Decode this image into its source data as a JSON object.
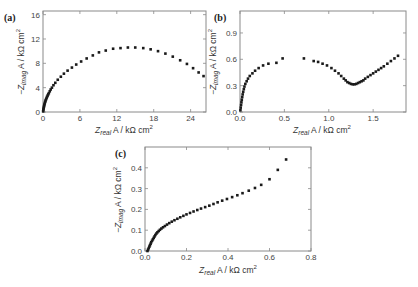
{
  "chart_data": [
    {
      "panel": "(a)",
      "type": "scatter",
      "title": "",
      "xlabel": "Z_real A / kΩ cm²",
      "ylabel": "−Z_imag A / kΩ cm²",
      "xlim": [
        0,
        26.5
      ],
      "ylim": [
        0,
        16.6
      ],
      "xticks": [
        0,
        6,
        12,
        18,
        24
      ],
      "yticks": [
        0,
        4,
        8,
        12,
        16
      ],
      "grid": false,
      "legend": null,
      "series": [
        {
          "name": "a",
          "x": [
            0.02,
            0.05,
            0.08,
            0.12,
            0.16,
            0.2,
            0.25,
            0.3,
            0.36,
            0.42,
            0.5,
            0.58,
            0.66,
            0.75,
            0.85,
            0.95,
            1.1,
            1.25,
            1.45,
            1.7,
            2.0,
            2.4,
            2.9,
            3.4,
            4.0,
            4.7,
            5.4,
            6.2,
            7.1,
            8.1,
            9.1,
            10.2,
            11.4,
            12.6,
            13.8,
            15.0,
            16.3,
            17.5,
            18.7,
            19.9,
            21.1,
            22.3,
            23.4,
            24.4,
            25.3,
            26.1
          ],
          "y": [
            0.1,
            0.3,
            0.5,
            0.7,
            0.9,
            1.1,
            1.3,
            1.5,
            1.7,
            1.9,
            2.1,
            2.3,
            2.5,
            2.7,
            2.9,
            3.1,
            3.4,
            3.7,
            4.0,
            4.4,
            4.8,
            5.3,
            5.8,
            6.3,
            6.8,
            7.3,
            7.8,
            8.3,
            8.8,
            9.3,
            9.8,
            10.1,
            10.4,
            10.5,
            10.6,
            10.6,
            10.5,
            10.3,
            10.0,
            9.6,
            9.1,
            8.5,
            7.9,
            7.2,
            6.5,
            5.9
          ]
        }
      ]
    },
    {
      "panel": "(b)",
      "type": "scatter",
      "title": "",
      "xlabel": "Z_real A / kΩ cm²",
      "ylabel": "−Z_imag A / kΩ cm²",
      "xlim": [
        0,
        1.87
      ],
      "ylim": [
        0,
        1.15
      ],
      "xticks": [
        0.0,
        0.5,
        1.0,
        1.5
      ],
      "yticks": [
        0.0,
        0.3,
        0.6,
        0.9
      ],
      "grid": false,
      "legend": null,
      "series": [
        {
          "name": "b",
          "x": [
            0.005,
            0.008,
            0.012,
            0.016,
            0.02,
            0.025,
            0.03,
            0.036,
            0.043,
            0.05,
            0.06,
            0.075,
            0.09,
            0.11,
            0.14,
            0.17,
            0.21,
            0.26,
            0.32,
            0.41,
            0.48,
            0.72,
            0.83,
            0.88,
            0.93,
            0.98,
            1.03,
            1.07,
            1.11,
            1.14,
            1.17,
            1.19,
            1.21,
            1.23,
            1.25,
            1.27,
            1.29,
            1.31,
            1.33,
            1.35,
            1.37,
            1.39,
            1.41,
            1.44,
            1.47,
            1.5,
            1.53,
            1.56,
            1.59,
            1.62,
            1.66,
            1.7,
            1.74,
            1.78
          ],
          "y": [
            0.02,
            0.05,
            0.08,
            0.11,
            0.14,
            0.17,
            0.2,
            0.23,
            0.26,
            0.29,
            0.32,
            0.35,
            0.38,
            0.41,
            0.44,
            0.47,
            0.5,
            0.53,
            0.55,
            0.56,
            0.61,
            0.61,
            0.58,
            0.57,
            0.55,
            0.53,
            0.5,
            0.47,
            0.44,
            0.41,
            0.38,
            0.36,
            0.34,
            0.33,
            0.32,
            0.315,
            0.315,
            0.32,
            0.33,
            0.34,
            0.35,
            0.36,
            0.38,
            0.4,
            0.42,
            0.44,
            0.46,
            0.48,
            0.5,
            0.52,
            0.55,
            0.58,
            0.61,
            0.64
          ]
        }
      ]
    },
    {
      "panel": "(c)",
      "type": "scatter",
      "title": "",
      "xlabel": "Z_real A / kΩ cm²",
      "ylabel": "−Z_imag A / kΩ cm²",
      "xlim": [
        0,
        0.8
      ],
      "ylim": [
        0,
        0.5
      ],
      "xticks": [
        0.0,
        0.2,
        0.4,
        0.6,
        0.8
      ],
      "yticks": [
        0.0,
        0.1,
        0.2,
        0.3,
        0.4
      ],
      "grid": false,
      "legend": null,
      "series": [
        {
          "name": "c",
          "x": [
            0.012,
            0.015,
            0.018,
            0.021,
            0.024,
            0.027,
            0.03,
            0.034,
            0.038,
            0.042,
            0.046,
            0.05,
            0.055,
            0.06,
            0.066,
            0.072,
            0.079,
            0.087,
            0.096,
            0.106,
            0.117,
            0.129,
            0.142,
            0.156,
            0.17,
            0.185,
            0.2,
            0.217,
            0.234,
            0.252,
            0.27,
            0.29,
            0.31,
            0.33,
            0.35,
            0.372,
            0.395,
            0.42,
            0.445,
            0.47,
            0.5,
            0.53,
            0.56,
            0.6,
            0.64,
            0.68
          ],
          "y": [
            0.0,
            0.007,
            0.014,
            0.021,
            0.028,
            0.035,
            0.042,
            0.049,
            0.056,
            0.063,
            0.07,
            0.077,
            0.084,
            0.09,
            0.096,
            0.102,
            0.108,
            0.114,
            0.12,
            0.127,
            0.134,
            0.141,
            0.148,
            0.155,
            0.162,
            0.169,
            0.176,
            0.183,
            0.19,
            0.197,
            0.204,
            0.211,
            0.218,
            0.226,
            0.234,
            0.242,
            0.25,
            0.259,
            0.268,
            0.278,
            0.29,
            0.303,
            0.318,
            0.345,
            0.39,
            0.44
          ]
        }
      ]
    }
  ],
  "panels": {
    "a": {
      "label": "(a)",
      "yticklabels": [
        "0",
        "4",
        "8",
        "12",
        "16"
      ],
      "xticklabels": [
        "0",
        "6",
        "12",
        "18",
        "24"
      ]
    },
    "b": {
      "label": "(b)",
      "yticklabels": [
        "0.0",
        "0.3",
        "0.6",
        "0.9"
      ],
      "xticklabels": [
        "0.0",
        "0.5",
        "1.0",
        "1.5"
      ]
    },
    "c": {
      "label": "(c)",
      "yticklabels": [
        "0.0",
        "0.1",
        "0.2",
        "0.3",
        "0.4"
      ],
      "xticklabels": [
        "0.0",
        "0.2",
        "0.4",
        "0.6",
        "0.8"
      ]
    }
  },
  "axis_labels": {
    "x_prefix": "Z",
    "x_sub": "real",
    "x_unit": " A / kΩ cm",
    "y_prefix": "−Z",
    "y_sub": "imag",
    "y_unit": " A / kΩ cm",
    "sup": "2"
  },
  "colors": {
    "marker": "#1a1a1a",
    "frame": "#8a8a8a",
    "text": "#333333"
  }
}
